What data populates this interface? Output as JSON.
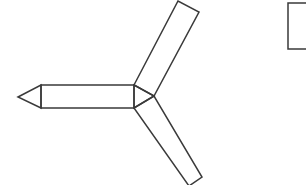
{
  "diagram": {
    "stroke_color": "#3a3a3a",
    "background": "#ffffff",
    "stroke_width": 1.5,
    "shapes": {
      "left_arm_tip": "18,97 41,85 41,108",
      "left_arm_body": "41,85 134,85 134,108 41,108",
      "center_triangle": "134,85 154,96 134,108",
      "upper_arm": "134,85 178,1 199,12 154,96",
      "lower_arm": "134,108 154,96 202,177 189,186",
      "partial_box": "288,3 310,3 310,49 288,49"
    }
  }
}
